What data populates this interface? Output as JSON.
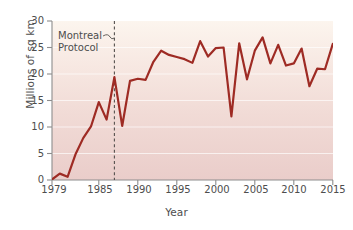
{
  "chart_data": {
    "type": "line",
    "title": "",
    "xlabel": "Year",
    "ylabel": "Millions of sq km",
    "xlim": [
      1979,
      2015
    ],
    "ylim": [
      0,
      30
    ],
    "grid": true,
    "legend_position": "none",
    "xticks": [
      "1979",
      "1985",
      "1990",
      "1995",
      "2000",
      "2005",
      "2010",
      "2015"
    ],
    "xtick_values": [
      1979,
      1985,
      1990,
      1995,
      2000,
      2005,
      2010,
      2015
    ],
    "yticks": [
      "0",
      "5",
      "10",
      "15",
      "20",
      "25",
      "30"
    ],
    "ytick_values": [
      0,
      5,
      10,
      15,
      20,
      25,
      30
    ],
    "series": [
      {
        "name": "Antarctic ozone hole area",
        "color": "#9e2b24",
        "x": [
          1979,
          1980,
          1981,
          1982,
          1983,
          1984,
          1985,
          1986,
          1987,
          1988,
          1989,
          1990,
          1991,
          1992,
          1993,
          1994,
          1995,
          1996,
          1997,
          1998,
          1999,
          2000,
          2001,
          2002,
          2003,
          2004,
          2005,
          2006,
          2007,
          2008,
          2009,
          2010,
          2011,
          2012,
          2013,
          2014,
          2015
        ],
        "values": [
          0.1,
          1.2,
          0.6,
          4.8,
          7.9,
          10.1,
          14.7,
          11.4,
          19.4,
          10.2,
          18.7,
          19.1,
          18.9,
          22.3,
          24.4,
          23.6,
          23.2,
          22.8,
          22.1,
          26.2,
          23.3,
          24.9,
          25.0,
          12.0,
          25.8,
          19.0,
          24.4,
          26.9,
          22.0,
          25.5,
          21.6,
          22.0,
          24.8,
          17.7,
          21.0,
          20.9,
          25.7
        ]
      }
    ],
    "annotations": [
      {
        "name": "montreal-protocol",
        "text_line1": "Montreal",
        "text_line2": "Protocol",
        "marker": "dashed-vertical-line",
        "x_value": 1987
      }
    ],
    "style": {
      "line_color": "#9e2b24",
      "bg_top_color": "#fbf3ec",
      "bg_bottom_color": "#eecfcc",
      "axis_color": "#8a8a8a",
      "gridline_color": "#ffffff",
      "text_color": "#4d4d4d",
      "dash_color": "#55514e"
    }
  }
}
